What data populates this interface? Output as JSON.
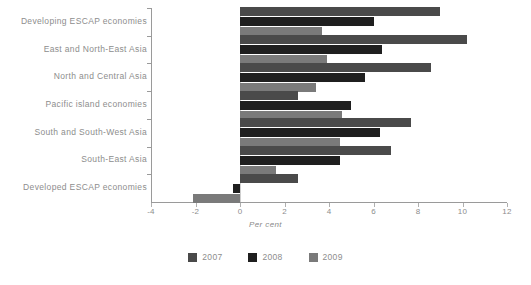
{
  "chart_data": {
    "type": "bar",
    "orientation": "horizontal",
    "title": "",
    "xlabel": "Per cent",
    "ylabel": "",
    "xlim": [
      -4,
      12
    ],
    "xticks": [
      -4,
      -2,
      0,
      2,
      4,
      6,
      8,
      10,
      12
    ],
    "xtick_labels": [
      "-4",
      "-2",
      "0",
      "2",
      "4",
      "6",
      "8",
      "10",
      "12"
    ],
    "grid": false,
    "legend_position": "bottom",
    "categories": [
      "Developing ESCAP economies",
      "East and North-East Asia",
      "North and Central Asia",
      "Pacific island economies",
      "South and South-West Asia",
      "South-East Asia",
      "Developed ESCAP economies"
    ],
    "series": [
      {
        "name": "2007",
        "color": "#4a4a4a",
        "values": [
          9.0,
          10.2,
          8.6,
          2.6,
          7.7,
          6.8,
          2.6
        ]
      },
      {
        "name": "2008",
        "color": "#1f1f1f",
        "values": [
          6.0,
          6.4,
          5.6,
          5.0,
          6.3,
          4.5,
          -0.3
        ]
      },
      {
        "name": "2009",
        "color": "#7a7a7a",
        "values": [
          3.7,
          3.9,
          3.4,
          4.6,
          4.5,
          1.6,
          -2.1
        ]
      }
    ]
  },
  "legend": {
    "items": [
      {
        "label": "2007",
        "color": "#4a4a4a"
      },
      {
        "label": "2008",
        "color": "#1f1f1f"
      },
      {
        "label": "2009",
        "color": "#7a7a7a"
      }
    ]
  },
  "axis": {
    "x_title": "Per cent"
  }
}
